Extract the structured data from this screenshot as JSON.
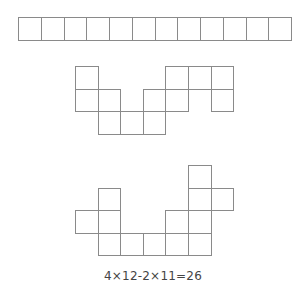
{
  "colors": {
    "stroke": "#8a8a8a",
    "fill": "#ffffff",
    "text": "#444444"
  },
  "shapes": [
    {
      "name": "strip-12",
      "origin": [
        18,
        17
      ],
      "cell": 22.75,
      "cells": [
        [
          0,
          0
        ],
        [
          1,
          0
        ],
        [
          2,
          0
        ],
        [
          3,
          0
        ],
        [
          4,
          0
        ],
        [
          5,
          0
        ],
        [
          6,
          0
        ],
        [
          7,
          0
        ],
        [
          8,
          0
        ],
        [
          9,
          0
        ],
        [
          10,
          0
        ],
        [
          11,
          0
        ]
      ]
    },
    {
      "name": "shape-middle",
      "origin": [
        75,
        66
      ],
      "cell": 22.6,
      "cells": [
        [
          0,
          0
        ],
        [
          0,
          1
        ],
        [
          1,
          1
        ],
        [
          1,
          2
        ],
        [
          2,
          2
        ],
        [
          3,
          1
        ],
        [
          3,
          2
        ],
        [
          4,
          0
        ],
        [
          4,
          1
        ],
        [
          5,
          0
        ],
        [
          6,
          0
        ],
        [
          6,
          1
        ]
      ]
    },
    {
      "name": "shape-bottom",
      "origin": [
        75,
        165
      ],
      "cell": 22.6,
      "cells": [
        [
          5,
          0
        ],
        [
          1,
          1
        ],
        [
          5,
          1
        ],
        [
          6,
          1
        ],
        [
          0,
          2
        ],
        [
          1,
          2
        ],
        [
          4,
          2
        ],
        [
          5,
          2
        ],
        [
          1,
          3
        ],
        [
          2,
          3
        ],
        [
          3,
          3
        ],
        [
          4,
          3
        ],
        [
          5,
          3
        ]
      ]
    }
  ],
  "formula": "4×12-2×11=26"
}
